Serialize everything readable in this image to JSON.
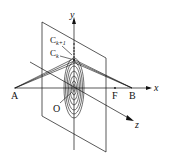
{
  "diagram": {
    "type": "3d-geometry",
    "axes": {
      "x": "x",
      "y": "y",
      "z": "z"
    },
    "points": {
      "A": "A",
      "B": "B",
      "F": "F",
      "O": "O",
      "Ck": "C",
      "Ck_sub": "k",
      "Ck1": "C",
      "Ck1_sub": "k+1"
    },
    "colors": {
      "line": "#111111",
      "background": "#ffffff"
    }
  }
}
